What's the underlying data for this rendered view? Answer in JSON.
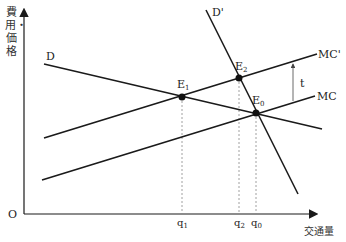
{
  "diagram": {
    "y_axis_label": "費用・価格",
    "x_axis_label": "交通量",
    "origin_label": "O",
    "curves": {
      "D": {
        "label": "D"
      },
      "D_prime": {
        "label": "D'"
      },
      "MC": {
        "label": "MC"
      },
      "MC_prime": {
        "label": "MC'"
      }
    },
    "tax_label": "t",
    "points": {
      "E0": {
        "letter": "E",
        "sub": "0"
      },
      "E1": {
        "letter": "E",
        "sub": "1"
      },
      "E2": {
        "letter": "E",
        "sub": "2"
      }
    },
    "x_ticks": [
      {
        "letter": "q",
        "sub": "1"
      },
      {
        "letter": "q",
        "sub": "2"
      },
      {
        "letter": "q",
        "sub": "0"
      }
    ],
    "colors": {
      "line": "#1a1a1a",
      "dashed": "#888888"
    }
  }
}
